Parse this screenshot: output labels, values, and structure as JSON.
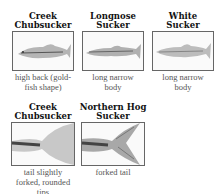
{
  "row1": [
    {
      "title_line1": "Creek",
      "title_line2": "Chubsucker",
      "desc_line1": "high back (gold-",
      "desc_line2": "fish shape)",
      "image": "creek-chubsucker-fish-image"
    },
    {
      "title_line1": "Longnose",
      "title_line2": "Sucker",
      "desc_line1": "long narrow",
      "desc_line2": "body",
      "image": "longnose-sucker-fish-image"
    },
    {
      "title_line1": "White",
      "title_line2": "Sucker",
      "desc_line1": "long narrow",
      "desc_line2": "body",
      "image": "white-sucker-fish-image"
    }
  ],
  "row2": [
    {
      "title_line1": "Creek",
      "title_line2": "Chubsucker",
      "desc_line1": "tail slightly",
      "desc_line2": "forked, rounded",
      "desc_line3": "tips",
      "image": "creek-chubsucker-tail-image"
    },
    {
      "title_line1": "Northern Hog",
      "title_line2": "Sucker",
      "desc_line1": "forked tail",
      "image": "northern-hog-sucker-tail-image"
    }
  ]
}
